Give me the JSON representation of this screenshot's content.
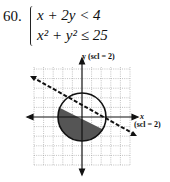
{
  "problem": {
    "number": "60.",
    "inequalities": [
      "x + 2y < 4",
      "x² + y² ≤ 25"
    ]
  },
  "graph": {
    "y_axis_label": "y (scl = 2)",
    "x_axis_label": "x",
    "x_scale_label": "(scl = 2)",
    "grid": "dotted",
    "circle": {
      "radius": 5,
      "boundary": "solid"
    },
    "line": {
      "equation": "x + 2y = 4",
      "boundary": "dashed"
    },
    "shaded_region": "inside circle, below line",
    "shade_color": "#555555"
  }
}
